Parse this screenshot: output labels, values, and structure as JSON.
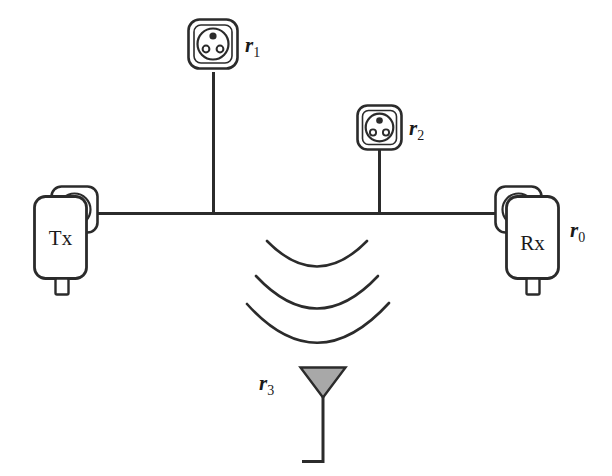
{
  "diagram": {
    "colors": {
      "stroke": "#2b2b2b",
      "background": "#ffffff",
      "antenna_fill": "#a8a8a8",
      "text": "#1a1a1a"
    },
    "devices": {
      "tx": {
        "label": "Tx",
        "kind": "powerline-adapter"
      },
      "rx": {
        "label": "Rx",
        "kind": "powerline-adapter",
        "node_label_main": "r",
        "node_label_sub": "0"
      }
    },
    "sockets": [
      {
        "id": "socket-r1",
        "label_main": "r",
        "label_sub": "1",
        "pin_count": 3
      },
      {
        "id": "socket-r2",
        "label_main": "r",
        "label_sub": "2",
        "pin_count": 3
      }
    ],
    "antenna": {
      "id": "antenna-r3",
      "label_main": "r",
      "label_sub": "3",
      "wave_arcs": 3
    },
    "powerline": {
      "name": "power-line-bus"
    }
  }
}
